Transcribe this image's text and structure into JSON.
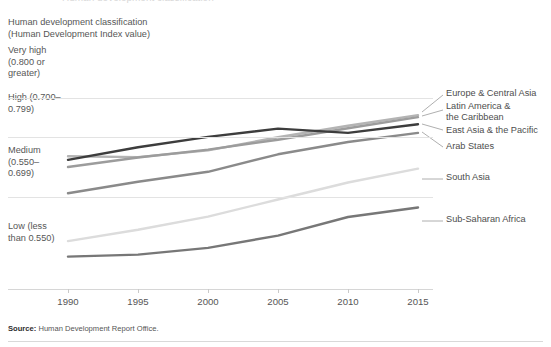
{
  "top_clipped_text": "Human development classification",
  "classification": {
    "header_line1": "Human development classification",
    "header_line2": "(Human Development Index value)",
    "bands": [
      {
        "name": "very-high",
        "label": "Very high\n(0.800 or\ngreater)"
      },
      {
        "name": "high",
        "label": "High\n(0.700–\n0.799)"
      },
      {
        "name": "medium",
        "label": "Medium\n(0.550–\n0.699)"
      },
      {
        "name": "low",
        "label": "Low\n(less than\n0.550)"
      }
    ]
  },
  "source": {
    "prefix": "Source:",
    "text": " Human Development Report Office."
  },
  "chart_data": {
    "type": "line",
    "title": "",
    "subtitle": "",
    "xlabel": "",
    "ylabel": "Human Development Index value",
    "x": [
      1990,
      1995,
      2000,
      2005,
      2010,
      2015
    ],
    "xlim": [
      1990,
      2015
    ],
    "ylim": [
      0.34,
      0.9
    ],
    "grid": true,
    "legend_position": "right-inline",
    "tick_labels": [
      "1990",
      "1995",
      "2000",
      "2005",
      "2010",
      "2015"
    ],
    "band_thresholds": [
      {
        "label": "Very high (0.800 or greater)",
        "min": 0.8
      },
      {
        "label": "High (0.700–0.799)",
        "min": 0.7,
        "max": 0.799
      },
      {
        "label": "Medium (0.550–0.699)",
        "min": 0.55,
        "max": 0.699
      },
      {
        "label": "Low (less than 0.550)",
        "max": 0.55
      }
    ],
    "series": [
      {
        "name": "Europe & Central Asia",
        "color": "#b4b4b4",
        "values": [
          0.652,
          0.65,
          0.667,
          0.7,
          0.729,
          0.756
        ]
      },
      {
        "name": "Latin America & the Caribbean",
        "color": "#9c9c9c",
        "values": [
          0.625,
          0.649,
          0.669,
          0.694,
          0.723,
          0.751
        ]
      },
      {
        "name": "East Asia & the Pacific",
        "color": "#3d3d3d",
        "values": [
          0.643,
          0.675,
          0.701,
          0.722,
          0.711,
          0.733
        ]
      },
      {
        "name": "Arab States",
        "color": "#8a8a8a",
        "values": [
          0.559,
          0.588,
          0.613,
          0.657,
          0.688,
          0.711
        ]
      },
      {
        "name": "South Asia",
        "color": "#dcdcdc",
        "values": [
          0.438,
          0.467,
          0.5,
          0.543,
          0.586,
          0.621
        ]
      },
      {
        "name": "Sub-Saharan Africa",
        "color": "#777777",
        "values": [
          0.399,
          0.404,
          0.421,
          0.452,
          0.499,
          0.523
        ]
      }
    ],
    "series_labels": [
      {
        "name": "Europe & Central Asia",
        "text": "Europe & Central Asia"
      },
      {
        "name": "Latin America & the Caribbean",
        "text": "Latin America &\nthe Caribbean"
      },
      {
        "name": "East Asia & the Pacific",
        "text": "East Asia & the Pacific"
      },
      {
        "name": "Arab States",
        "text": "Arab States"
      },
      {
        "name": "South Asia",
        "text": "South Asia"
      },
      {
        "name": "Sub-Saharan Africa",
        "text": "Sub-Saharan Africa"
      }
    ]
  }
}
